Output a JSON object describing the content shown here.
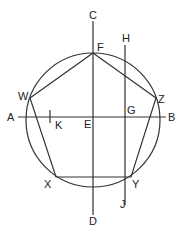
{
  "diagram": {
    "labels": {
      "A": "A",
      "B": "B",
      "C": "C",
      "D": "D",
      "E": "E",
      "F": "F",
      "G": "G",
      "H": "H",
      "J": "J",
      "K": "K",
      "W": "W",
      "X": "X",
      "Y": "Y",
      "Z": "Z"
    },
    "colors": {
      "stroke": "#333333",
      "background": "#ffffff"
    }
  }
}
